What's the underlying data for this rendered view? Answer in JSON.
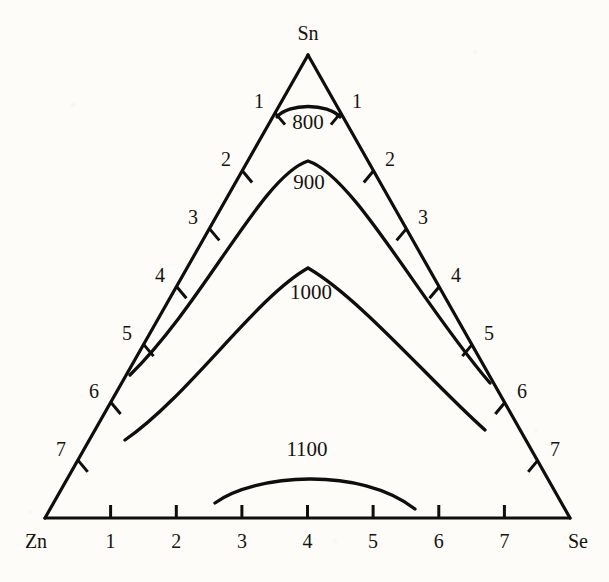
{
  "figure": {
    "type": "ternary-phase-diagram",
    "title": "",
    "background_color": "#fdfcf8",
    "ink_color": "#100e0c"
  },
  "vertices": {
    "top": {
      "label": "Sn",
      "x": 308,
      "y": 55
    },
    "bottom_left": {
      "label": "Zn",
      "x": 45,
      "y": 518
    },
    "bottom_right": {
      "label": "Se",
      "x": 570,
      "y": 518
    }
  },
  "axes": {
    "bottom": {
      "from_label": "Zn",
      "to_label": "Se",
      "tick_labels": [
        "1",
        "2",
        "3",
        "4",
        "5",
        "6",
        "7"
      ]
    },
    "left": {
      "from_label": "Sn",
      "to_label": "Zn",
      "tick_labels": [
        "1",
        "2",
        "3",
        "4",
        "5",
        "6",
        "7"
      ]
    },
    "right": {
      "from_label": "Sn",
      "to_label": "Se",
      "tick_labels": [
        "1",
        "2",
        "3",
        "4",
        "5",
        "6",
        "7"
      ]
    }
  },
  "isotherms": [
    {
      "label": "800",
      "label_x": 308,
      "label_y": 129,
      "path": "M 277,117 C 288,103 328,103 340,117"
    },
    {
      "label": "900",
      "label_x": 309,
      "label_y": 189,
      "path": "M 130,375 C 206,300 262,176 308,161 C 354,176 420,302 490,383"
    },
    {
      "label": "1000",
      "label_x": 311,
      "label_y": 299,
      "path": "M 125,440 C 190,395 255,298 308,268 C 360,298 432,383 485,430"
    },
    {
      "label": "1100",
      "label_x": 307,
      "label_y": 456,
      "path": "M 215,503 C 255,474 360,466 415,509"
    }
  ],
  "chart_data": {
    "type": "line",
    "xlabel": "",
    "ylabel": "",
    "components": [
      "Sn",
      "Zn",
      "Se"
    ],
    "axis_tick_labels": [
      "1",
      "2",
      "3",
      "4",
      "5",
      "6",
      "7"
    ],
    "grid": false,
    "legend": "none",
    "annotations": [
      "800",
      "900",
      "1000",
      "1100"
    ],
    "series": [
      {
        "name": "800",
        "units": "",
        "endpoints_on_axes": [
          1,
          1
        ],
        "peak_axis_value": 4
      },
      {
        "name": "900",
        "units": "",
        "endpoints_on_axes": [
          5,
          5
        ],
        "peak_axis_value": 4
      },
      {
        "name": "1000",
        "units": "",
        "endpoints_on_axes": [
          6,
          6
        ],
        "peak_axis_value": 4
      },
      {
        "name": "1100",
        "units": "",
        "endpoints_on_axes": [
          2.6,
          5.6
        ],
        "peak_axis_value": 4
      }
    ]
  }
}
